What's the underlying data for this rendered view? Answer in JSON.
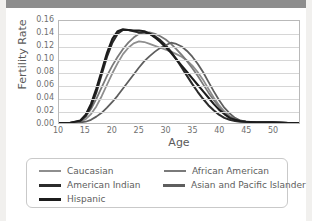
{
  "header": {
    "title": ""
  },
  "chart_data": {
    "type": "line",
    "title": "",
    "xlabel": "Age",
    "ylabel": "Fertility Rate",
    "xlim": [
      10,
      55
    ],
    "ylim": [
      0.0,
      0.16
    ],
    "xticks": [
      10,
      15,
      20,
      25,
      30,
      35,
      40,
      45,
      50
    ],
    "ytick_labels": [
      "0.16",
      "0.14",
      "0.12",
      "0.10",
      "0.08",
      "0.06",
      "0.04",
      "0.02",
      "0.00"
    ],
    "yticks": [
      0.16,
      0.14,
      0.12,
      0.1,
      0.08,
      0.06,
      0.04,
      0.02,
      0.0
    ],
    "grid": "horizontal",
    "legend_position": "bottom",
    "x": [
      10,
      12,
      14,
      15,
      16,
      17,
      18,
      19,
      20,
      21,
      22,
      23,
      24,
      25,
      26,
      27,
      28,
      29,
      30,
      31,
      32,
      33,
      34,
      35,
      36,
      37,
      38,
      39,
      40,
      41,
      42,
      43,
      44,
      45,
      47,
      50,
      53,
      55
    ],
    "series": [
      {
        "name": "Caucasian",
        "color": "#8e8e8e",
        "values": [
          0.0,
          0.0,
          0.002,
          0.006,
          0.014,
          0.026,
          0.042,
          0.06,
          0.078,
          0.094,
          0.108,
          0.118,
          0.125,
          0.128,
          0.127,
          0.124,
          0.121,
          0.118,
          0.115,
          0.112,
          0.108,
          0.104,
          0.098,
          0.09,
          0.08,
          0.068,
          0.054,
          0.04,
          0.028,
          0.018,
          0.011,
          0.006,
          0.003,
          0.002,
          0.001,
          0.001,
          0.0,
          0.0
        ]
      },
      {
        "name": "African American",
        "color": "#7a7a7a",
        "values": [
          0.0,
          0.0,
          0.003,
          0.01,
          0.022,
          0.038,
          0.056,
          0.074,
          0.09,
          0.104,
          0.116,
          0.126,
          0.134,
          0.14,
          0.142,
          0.142,
          0.14,
          0.136,
          0.131,
          0.124,
          0.116,
          0.107,
          0.097,
          0.086,
          0.074,
          0.061,
          0.048,
          0.036,
          0.025,
          0.016,
          0.01,
          0.005,
          0.003,
          0.002,
          0.001,
          0.001,
          0.0,
          0.0
        ]
      },
      {
        "name": "American Indian",
        "color": "#2b2b2b",
        "values": [
          0.0,
          0.0,
          0.003,
          0.011,
          0.026,
          0.048,
          0.076,
          0.104,
          0.126,
          0.14,
          0.146,
          0.146,
          0.144,
          0.142,
          0.142,
          0.14,
          0.136,
          0.13,
          0.122,
          0.112,
          0.1,
          0.087,
          0.074,
          0.061,
          0.049,
          0.038,
          0.028,
          0.02,
          0.013,
          0.008,
          0.005,
          0.003,
          0.002,
          0.002,
          0.001,
          0.001,
          0.0,
          0.0
        ]
      },
      {
        "name": "Asian and Pacific Islander",
        "color": "#5e5e5e",
        "values": [
          0.0,
          0.0,
          0.001,
          0.002,
          0.005,
          0.01,
          0.016,
          0.024,
          0.033,
          0.043,
          0.054,
          0.065,
          0.076,
          0.087,
          0.097,
          0.105,
          0.112,
          0.118,
          0.122,
          0.126,
          0.124,
          0.12,
          0.113,
          0.104,
          0.093,
          0.08,
          0.065,
          0.05,
          0.036,
          0.024,
          0.015,
          0.008,
          0.004,
          0.002,
          0.001,
          0.001,
          0.0,
          0.0
        ]
      },
      {
        "name": "Hispanic",
        "color": "#1c1c1c",
        "values": [
          0.0,
          0.0,
          0.004,
          0.013,
          0.03,
          0.054,
          0.082,
          0.11,
          0.132,
          0.144,
          0.147,
          0.146,
          0.145,
          0.145,
          0.144,
          0.14,
          0.134,
          0.127,
          0.119,
          0.11,
          0.1,
          0.09,
          0.08,
          0.07,
          0.06,
          0.05,
          0.04,
          0.03,
          0.021,
          0.014,
          0.008,
          0.005,
          0.003,
          0.002,
          0.001,
          0.001,
          0.0,
          0.0
        ]
      }
    ]
  },
  "legend": {
    "rows": [
      [
        {
          "label": "Caucasian",
          "color": "#8e8e8e",
          "width": 2
        },
        {
          "label": "African American",
          "color": "#7a7a7a",
          "width": 2
        }
      ],
      [
        {
          "label": "American Indian",
          "color": "#2b2b2b",
          "width": 3
        },
        {
          "label": "Asian and Pacific Islander",
          "color": "#5e5e5e",
          "width": 3
        }
      ],
      [
        {
          "label": "Hispanic",
          "color": "#1c1c1c",
          "width": 3
        }
      ]
    ]
  }
}
